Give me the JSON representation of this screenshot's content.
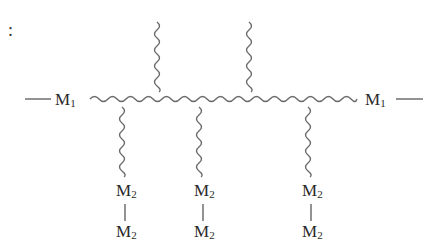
{
  "diagram": {
    "leading_symbol": ":",
    "backbone": {
      "left_end": {
        "label": "M",
        "subscript": "1"
      },
      "right_end": {
        "label": "M",
        "subscript": "1"
      }
    },
    "upper_branches": 2,
    "lower_branches": [
      {
        "top": {
          "label": "M",
          "subscript": "2"
        },
        "bottom": {
          "label": "M",
          "subscript": "2"
        }
      },
      {
        "top": {
          "label": "M",
          "subscript": "2"
        },
        "bottom": {
          "label": "M",
          "subscript": "2"
        }
      },
      {
        "top": {
          "label": "M",
          "subscript": "2"
        },
        "bottom": {
          "label": "M",
          "subscript": "2"
        }
      }
    ],
    "colors": {
      "text": "#2a2a2a",
      "chain": "#6a6a6a",
      "background": "#ffffff"
    }
  }
}
